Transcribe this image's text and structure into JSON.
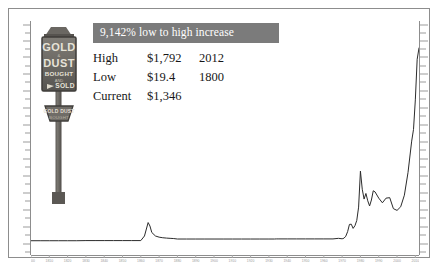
{
  "banner": {
    "text": "9,142% low to high increase",
    "bg_color": "#7b7b7b",
    "text_color": "#ffffff"
  },
  "stats": {
    "rows": [
      {
        "label": "High",
        "value": "$1,792",
        "year": "2012"
      },
      {
        "label": "Low",
        "value": "$19.4",
        "year": "1800"
      },
      {
        "label": "Current",
        "value": "$1,346",
        "year": ""
      }
    ]
  },
  "sign": {
    "top_lines": [
      "GOLD",
      "DUST",
      "BOUGHT",
      "AND",
      "SOLD"
    ],
    "bottom_lines": [
      "GOLD DUST",
      "BOUGHT"
    ],
    "body_color": "#6d6a66",
    "post_color": "#6f6c68"
  },
  "chart_data": {
    "type": "line",
    "title": "",
    "xlabel": "",
    "ylabel": "",
    "grid": false,
    "legend": null,
    "line_color": "#2b2b2b",
    "xlim": [
      1800,
      2012
    ],
    "ylim": [
      0,
      1900
    ],
    "x_tick_labels": [
      "1800",
      "1810",
      "1820",
      "1830",
      "1840",
      "1850",
      "1860",
      "1870",
      "1880",
      "1890",
      "1900",
      "1910",
      "1920",
      "1930",
      "1940",
      "1950",
      "1960",
      "1970",
      "1980",
      "1990",
      "2000",
      "2010"
    ],
    "series": [
      {
        "name": "Gold price (USD per ounce)",
        "x": [
          1800,
          1805,
          1810,
          1815,
          1820,
          1825,
          1830,
          1835,
          1840,
          1845,
          1850,
          1855,
          1860,
          1862,
          1864,
          1865,
          1866,
          1868,
          1870,
          1872,
          1874,
          1876,
          1878,
          1880,
          1885,
          1890,
          1895,
          1900,
          1905,
          1910,
          1915,
          1920,
          1925,
          1930,
          1933,
          1934,
          1935,
          1940,
          1945,
          1950,
          1955,
          1960,
          1965,
          1968,
          1970,
          1971,
          1972,
          1973,
          1974,
          1975,
          1976,
          1977,
          1978,
          1979,
          1980,
          1981,
          1982,
          1983,
          1984,
          1985,
          1986,
          1987,
          1988,
          1990,
          1992,
          1994,
          1996,
          1998,
          2000,
          2002,
          2004,
          2006,
          2008,
          2009,
          2010,
          2011,
          2012
        ],
        "y": [
          19.4,
          19.4,
          19.4,
          19.4,
          19.4,
          19.4,
          20.7,
          20.7,
          20.7,
          20.7,
          20.7,
          20.7,
          20.7,
          60,
          175,
          145,
          90,
          60,
          50,
          45,
          42,
          40,
          38,
          34,
          34,
          34,
          34,
          34,
          34,
          34,
          34,
          34,
          34,
          34,
          34,
          35,
          35,
          35,
          35,
          35,
          35,
          35,
          35,
          40,
          36,
          41,
          58,
          97,
          159,
          161,
          125,
          148,
          193,
          307,
          615,
          460,
          376,
          424,
          361,
          317,
          368,
          447,
          437,
          384,
          344,
          384,
          388,
          294,
          279,
          310,
          409,
          604,
          872,
          972,
          1225,
          1572,
          1669
        ]
      }
    ],
    "annotations": [
      {
        "type": "high",
        "label": "High",
        "value": 1792,
        "year": 2012
      },
      {
        "type": "low",
        "label": "Low",
        "value": 19.4,
        "year": 1800
      },
      {
        "type": "current",
        "label": "Current",
        "value": 1346,
        "year": null
      }
    ]
  }
}
